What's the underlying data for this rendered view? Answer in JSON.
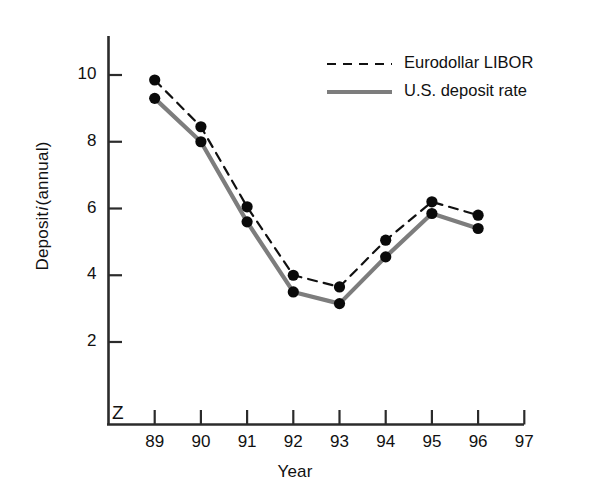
{
  "chart_data": {
    "type": "line",
    "title": "",
    "xlabel": "Year",
    "ylabel": "Deposit i (annual)",
    "ylabel_plain": "Deposit",
    "ylabel_italic": "i",
    "ylabel_suffix": "(annual)",
    "categories": [
      "89",
      "90",
      "91",
      "92",
      "93",
      "94",
      "95",
      "96",
      "97"
    ],
    "x_tick_labels": [
      "89",
      "90",
      "91",
      "92",
      "93",
      "94",
      "95",
      "96",
      "97"
    ],
    "y_tick_labels": [
      "2",
      "4",
      "6",
      "8",
      "10"
    ],
    "y_ticks": [
      2,
      4,
      6,
      8,
      10
    ],
    "ylim": [
      0,
      11.3
    ],
    "xlim_categories": 9,
    "grid": false,
    "legend_position": "top-right",
    "axis_break_symbol": "Z",
    "series": [
      {
        "name": "Eurodollar LIBOR",
        "style": "dashed",
        "color": "#111111",
        "marker": "filled-circle",
        "x": [
          "89",
          "90",
          "91",
          "92",
          "93",
          "94",
          "95",
          "96"
        ],
        "values": [
          9.85,
          8.45,
          6.05,
          4.0,
          3.65,
          5.05,
          6.2,
          5.8
        ]
      },
      {
        "name": "U.S. deposit rate",
        "style": "solid",
        "color": "#7d7d7d",
        "marker": "filled-circle",
        "x": [
          "89",
          "90",
          "91",
          "92",
          "93",
          "94",
          "95",
          "96"
        ],
        "values": [
          9.3,
          8.0,
          5.6,
          3.5,
          3.15,
          4.55,
          5.85,
          5.4
        ]
      }
    ]
  },
  "legend": {
    "entries": [
      {
        "label": "Eurodollar LIBOR",
        "style": "dashed",
        "color": "#111111"
      },
      {
        "label": "U.S. deposit rate",
        "style": "solid",
        "color": "#7d7d7d"
      }
    ]
  },
  "axes": {
    "y_title_plain": "Deposit",
    "y_title_italic": "i",
    "y_title_suffix": "(annual)",
    "x_title": "Year",
    "break_symbol": "Z"
  },
  "colors": {
    "background": "#ffffff",
    "axis": "#2b2b2b",
    "dashed_series": "#111111",
    "solid_series": "#7d7d7d",
    "marker": "#0a0a0a",
    "text": "#111111"
  }
}
